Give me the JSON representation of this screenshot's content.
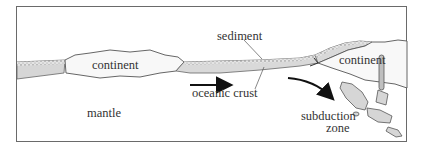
{
  "diagram": {
    "type": "plate-tectonics-cross-section",
    "labels": {
      "continent_left": "continent",
      "continent_right": "continent",
      "sediment": "sediment",
      "oceanic_crust": "oceanic crust",
      "mantle": "mantle",
      "subduction_line1": "subduction",
      "subduction_line2": "zone"
    },
    "colors": {
      "frame": "#6a6a6a",
      "outline": "#555555",
      "crust_fill": "#dcdcdc",
      "continent_fill": "#f7f7f7",
      "arrow": "#111111"
    }
  }
}
